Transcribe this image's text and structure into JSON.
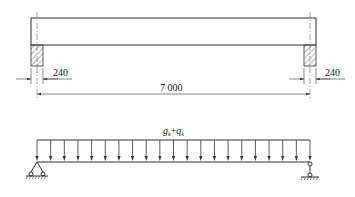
{
  "figure": {
    "elevation": {
      "left_support_width_label": "240",
      "right_support_width_label": "240",
      "span_label": "7 000"
    },
    "load_diagram": {
      "load_label_g": "g",
      "load_label_g_sub": "k",
      "load_label_plus": "+",
      "load_label_q": "q",
      "load_label_q_sub": "k",
      "arrow_count": 21,
      "left_support": "pin",
      "right_support": "roller"
    }
  }
}
